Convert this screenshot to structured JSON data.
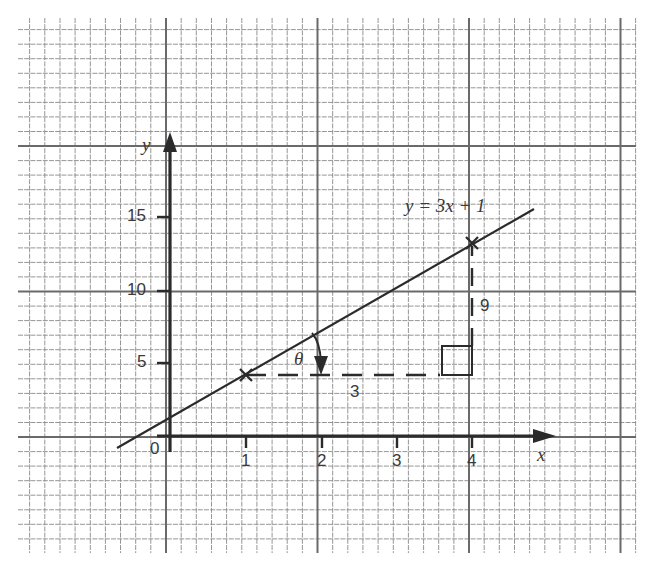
{
  "chart_data": {
    "type": "line",
    "title": "",
    "equation_label": "y = 3x + 1",
    "xlabel": "x",
    "ylabel": "y",
    "origin_label": "0",
    "x_ticks": [
      1,
      2,
      3,
      4
    ],
    "x_tick_labels": [
      "1",
      "2",
      "3",
      "4"
    ],
    "y_ticks": [
      5,
      10,
      15
    ],
    "y_tick_labels": [
      "5",
      "10",
      "15"
    ],
    "xlim": [
      -0.7,
      5.0
    ],
    "ylim": [
      -1,
      20
    ],
    "grid": true,
    "series": [
      {
        "name": "y = 3x + 1",
        "slope": 3,
        "intercept": 1,
        "x": [
          -0.7,
          0,
          1,
          2,
          3,
          4,
          4.8
        ],
        "y": [
          -1.1,
          1,
          4,
          7,
          10,
          13,
          15.4
        ]
      }
    ],
    "marked_points": [
      {
        "x": 1,
        "y": 4,
        "marker": "cross"
      },
      {
        "x": 4,
        "y": 13,
        "marker": "cross"
      }
    ],
    "annotations": {
      "run_label": "3",
      "rise_label": "9",
      "angle_label": "θ",
      "right_angle_marker": true
    }
  },
  "labels": {
    "y_axis": "y",
    "x_axis": "x",
    "origin": "0",
    "equation": "y = 3x + 1",
    "angle": "θ",
    "run": "3",
    "rise": "9",
    "ytick_5": "5",
    "ytick_10": "10",
    "ytick_15": "15",
    "xtick_1": "1",
    "xtick_2": "2",
    "xtick_3": "3",
    "xtick_4": "4"
  },
  "colors": {
    "ink": "#2b2b2b",
    "grid_minor": "#8a8a8a",
    "grid_major": "#6a6a6a",
    "background": "#ffffff"
  }
}
